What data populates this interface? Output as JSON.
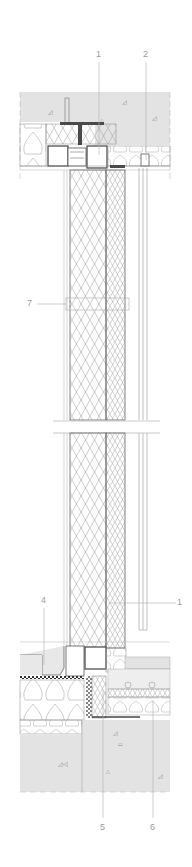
{
  "drawing": {
    "type": "architectural-wall-section",
    "colors": {
      "background": "#ffffff",
      "line": "#6e6e6e",
      "light_line": "#b0b0b0",
      "concrete": "#e3e3e3",
      "dark_steel": "#4a4a4a",
      "callout_text": "#9a9a9a"
    }
  },
  "callouts": [
    {
      "id": "callout-1-top",
      "label": "1"
    },
    {
      "id": "callout-2",
      "label": "2"
    },
    {
      "id": "callout-7",
      "label": "7"
    },
    {
      "id": "callout-4",
      "label": "4"
    },
    {
      "id": "callout-1-bottom",
      "label": "1"
    },
    {
      "id": "callout-5",
      "label": "5"
    },
    {
      "id": "callout-6",
      "label": "6"
    }
  ]
}
